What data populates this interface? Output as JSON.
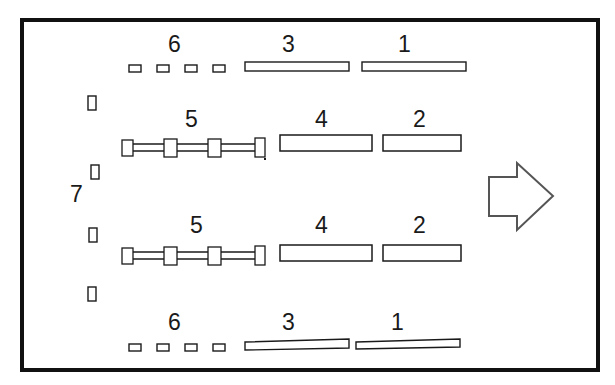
{
  "figure": {
    "type": "technical-line-drawing",
    "background_color": "#ffffff",
    "line_color": "#1a1a1a",
    "frame": {
      "name": "outer-frame",
      "x": 20,
      "y": 18,
      "width": 580,
      "height": 354,
      "stroke_width": 4
    },
    "direction_arrow": {
      "name": "direction-arrow",
      "points": "488,176 516,176 516,162 552,196 516,230 516,216 488,216",
      "stroke_width": 2,
      "fill": "none"
    },
    "callouts": [
      {
        "id": "c-6-top",
        "text": "6",
        "x": 168,
        "y": 35
      },
      {
        "id": "c-3-top",
        "text": "3",
        "x": 282,
        "y": 35
      },
      {
        "id": "c-1-top",
        "text": "1",
        "x": 398,
        "y": 35
      },
      {
        "id": "c-5-upper",
        "text": "5",
        "x": 184,
        "y": 110
      },
      {
        "id": "c-4-upper",
        "text": "4",
        "x": 314,
        "y": 110
      },
      {
        "id": "c-2-upper",
        "text": "2",
        "x": 412,
        "y": 110
      },
      {
        "id": "c-7-left",
        "text": "7",
        "x": 70,
        "y": 185
      },
      {
        "id": "c-5-lower",
        "text": "5",
        "x": 189,
        "y": 216
      },
      {
        "id": "c-4-lower",
        "text": "4",
        "x": 314,
        "y": 216
      },
      {
        "id": "c-2-lower",
        "text": "2",
        "x": 412,
        "y": 216
      },
      {
        "id": "c-6-bottom",
        "text": "6",
        "x": 168,
        "y": 313
      },
      {
        "id": "c-3-bottom",
        "text": "3",
        "x": 282,
        "y": 313
      },
      {
        "id": "c-1-bottom",
        "text": "1",
        "x": 390,
        "y": 313
      }
    ],
    "thin_bars": [
      {
        "name": "bar-3-top",
        "label": "3",
        "x": 245,
        "y": 62,
        "width": 104,
        "height": 9
      },
      {
        "name": "bar-1-top",
        "label": "1",
        "x": 362,
        "y": 62,
        "width": 104,
        "height": 9
      },
      {
        "name": "bar-3-bottom",
        "label": "3",
        "x": 245,
        "y": 340,
        "width": 104,
        "height": 9
      },
      {
        "name": "bar-1-bottom",
        "label": "1",
        "x": 356,
        "y": 340,
        "width": 104,
        "height": 9
      }
    ],
    "thick_bars": [
      {
        "name": "bar-4-upper",
        "label": "4",
        "x": 280,
        "y": 135,
        "width": 92,
        "height": 16
      },
      {
        "name": "bar-2-upper",
        "label": "2",
        "x": 383,
        "y": 135,
        "width": 78,
        "height": 16
      },
      {
        "name": "bar-4-lower",
        "label": "4",
        "x": 280,
        "y": 245,
        "width": 92,
        "height": 16
      },
      {
        "name": "bar-2-lower",
        "label": "2",
        "x": 383,
        "y": 245,
        "width": 78,
        "height": 16
      }
    ],
    "small_blocks_6": [
      {
        "name": "block-6-a",
        "x": 129,
        "y": 65,
        "width": 12,
        "height": 7
      },
      {
        "name": "block-6-b",
        "x": 157,
        "y": 65,
        "width": 12,
        "height": 7
      },
      {
        "name": "block-6-c",
        "x": 185,
        "y": 65,
        "width": 12,
        "height": 7
      },
      {
        "name": "block-6-d",
        "x": 213,
        "y": 65,
        "width": 12,
        "height": 7
      },
      {
        "name": "block-6-e",
        "x": 129,
        "y": 344,
        "width": 12,
        "height": 7
      },
      {
        "name": "block-6-f",
        "x": 157,
        "y": 344,
        "width": 12,
        "height": 7
      },
      {
        "name": "block-6-g",
        "x": 185,
        "y": 344,
        "width": 12,
        "height": 7
      },
      {
        "name": "block-6-h",
        "x": 213,
        "y": 344,
        "width": 12,
        "height": 7
      }
    ],
    "side_blocks_7": [
      {
        "name": "block-7-a",
        "x": 88,
        "y": 96,
        "width": 8,
        "height": 14
      },
      {
        "name": "block-7-b",
        "x": 91,
        "y": 165,
        "width": 8,
        "height": 14
      },
      {
        "name": "block-7-c",
        "x": 89,
        "y": 228,
        "width": 8,
        "height": 14
      },
      {
        "name": "block-7-d",
        "x": 88,
        "y": 287,
        "width": 8,
        "height": 14
      }
    ],
    "rod_assemblies": [
      {
        "name": "rod-assembly-5-upper",
        "label": "5",
        "rail_y_top": 143,
        "rail_y_bottom": 152,
        "rail_x_start": 128,
        "rail_x_end": 262,
        "collars": [
          {
            "name": "collar-left",
            "x": 122,
            "y": 140,
            "width": 11,
            "height": 16
          },
          {
            "name": "collar-mid-1",
            "x": 164,
            "y": 139,
            "width": 13,
            "height": 18
          },
          {
            "name": "collar-mid-2",
            "x": 208,
            "y": 139,
            "width": 13,
            "height": 18
          },
          {
            "name": "collar-right",
            "x": 255,
            "y": 138,
            "width": 10,
            "height": 19
          }
        ]
      },
      {
        "name": "rod-assembly-5-lower",
        "label": "5",
        "rail_y_top": 251,
        "rail_y_bottom": 260,
        "rail_x_start": 128,
        "rail_x_end": 262,
        "collars": [
          {
            "name": "collar-left",
            "x": 122,
            "y": 248,
            "width": 11,
            "height": 16
          },
          {
            "name": "collar-mid-1",
            "x": 164,
            "y": 247,
            "width": 13,
            "height": 18
          },
          {
            "name": "collar-mid-2",
            "x": 208,
            "y": 247,
            "width": 13,
            "height": 18
          },
          {
            "name": "collar-right",
            "x": 255,
            "y": 246,
            "width": 10,
            "height": 19
          }
        ]
      }
    ]
  }
}
